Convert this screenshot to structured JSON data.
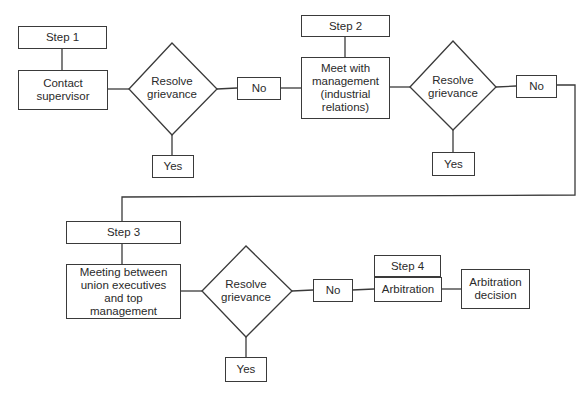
{
  "diagram": {
    "type": "flowchart",
    "nodes": {
      "step1": "Step 1",
      "contact_supervisor": "Contact supervisor",
      "decision1": "Resolve grievance",
      "no1": "No",
      "yes1": "Yes",
      "step2": "Step 2",
      "meet_management": "Meet with management (industrial relations)",
      "decision2": "Resolve grievance",
      "no2": "No",
      "yes2": "Yes",
      "step3": "Step 3",
      "meeting_union": "Meeting between union executives and top management",
      "decision3": "Resolve grievance",
      "no3": "No",
      "yes3": "Yes",
      "step4": "Step 4",
      "arbitration": "Arbitration",
      "arbitration_decision": "Arbitration decision"
    },
    "edges": [
      [
        "step1",
        "contact_supervisor"
      ],
      [
        "contact_supervisor",
        "decision1"
      ],
      [
        "decision1",
        "no1"
      ],
      [
        "decision1",
        "yes1"
      ],
      [
        "no1",
        "meet_management"
      ],
      [
        "step2",
        "meet_management"
      ],
      [
        "meet_management",
        "decision2"
      ],
      [
        "decision2",
        "no2"
      ],
      [
        "decision2",
        "yes2"
      ],
      [
        "no2",
        "step3"
      ],
      [
        "step3",
        "meeting_union"
      ],
      [
        "meeting_union",
        "decision3"
      ],
      [
        "decision3",
        "no3"
      ],
      [
        "decision3",
        "yes3"
      ],
      [
        "no3",
        "arbitration"
      ],
      [
        "step4",
        "arbitration"
      ],
      [
        "arbitration",
        "arbitration_decision"
      ]
    ]
  }
}
